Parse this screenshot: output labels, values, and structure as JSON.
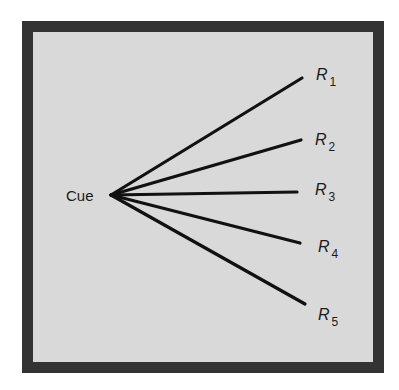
{
  "diagram": {
    "type": "fan-out",
    "colors": {
      "frame": "#333333",
      "background": "#d9d9d9",
      "line": "#111111"
    },
    "source": {
      "label": "Cue",
      "x": 111,
      "y": 195
    },
    "responses": [
      {
        "label": "R",
        "sub": "1",
        "x2": 302,
        "y2": 78,
        "lx": 316,
        "ly": 80
      },
      {
        "label": "R",
        "sub": "2",
        "x2": 301,
        "y2": 140,
        "lx": 315,
        "ly": 145
      },
      {
        "label": "R",
        "sub": "3",
        "x2": 297,
        "y2": 192,
        "lx": 315,
        "ly": 195
      },
      {
        "label": "R",
        "sub": "4",
        "x2": 300,
        "y2": 243,
        "lx": 318,
        "ly": 252
      },
      {
        "label": "R",
        "sub": "5",
        "x2": 305,
        "y2": 304,
        "lx": 318,
        "ly": 320
      }
    ]
  }
}
